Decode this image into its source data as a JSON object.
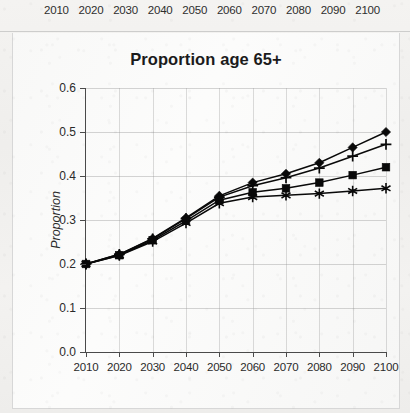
{
  "page": {
    "background_color": "#f2f1ef",
    "panel_color": "#fbfbfa"
  },
  "top_strip": {
    "name": "clipped-chart-above",
    "year_labels": [
      "2010",
      "2020",
      "2030",
      "2040",
      "2050",
      "2060",
      "2070",
      "2080",
      "2090",
      "2100"
    ]
  },
  "chart_data": {
    "type": "line",
    "title": "Proportion age 65+",
    "xlabel": "",
    "ylabel": "Proportion",
    "x": [
      2010,
      2020,
      2030,
      2040,
      2050,
      2060,
      2070,
      2080,
      2090,
      2100
    ],
    "xtick_labels": [
      "2010",
      "2020",
      "2030",
      "2040",
      "2050",
      "2060",
      "2070",
      "2080",
      "2090",
      "2100"
    ],
    "xlim": [
      2010,
      2100
    ],
    "ylim": [
      0.0,
      0.6
    ],
    "ytick_labels": [
      "0.0",
      "0.1",
      "0.2",
      "0.3",
      "0.4",
      "0.5",
      "0.6"
    ],
    "ytick_values": [
      0.0,
      0.1,
      0.2,
      0.3,
      0.4,
      0.5,
      0.6
    ],
    "grid": true,
    "legend": null,
    "series_color": "#090909",
    "series": [
      {
        "name": "diamond-series",
        "marker": "diamond",
        "values": [
          0.2,
          0.222,
          0.258,
          0.305,
          0.355,
          0.385,
          0.405,
          0.43,
          0.465,
          0.5
        ]
      },
      {
        "name": "plus-series",
        "marker": "plus",
        "values": [
          0.2,
          0.222,
          0.257,
          0.303,
          0.352,
          0.378,
          0.396,
          0.418,
          0.445,
          0.472
        ]
      },
      {
        "name": "square-series",
        "marker": "square",
        "values": [
          0.2,
          0.22,
          0.254,
          0.298,
          0.345,
          0.363,
          0.372,
          0.385,
          0.402,
          0.42
        ]
      },
      {
        "name": "star-series",
        "marker": "star",
        "values": [
          0.2,
          0.219,
          0.251,
          0.293,
          0.338,
          0.352,
          0.356,
          0.36,
          0.366,
          0.372
        ]
      }
    ]
  }
}
